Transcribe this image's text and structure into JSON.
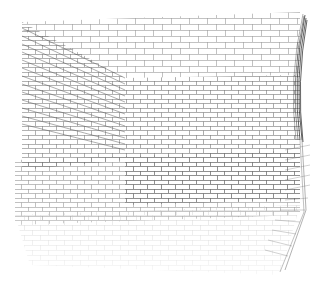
{
  "image": {
    "description": "Wireframe 3D render of a brick-patterned room / box viewed in perspective",
    "background": "#ffffff",
    "line_color": "#555555",
    "dark_edge_color": "#222222"
  },
  "scene": {
    "back_wall": {
      "brick_rows": 20,
      "brick_width": 18,
      "brick_height": 6
    },
    "left_wall": {
      "brick_rows": 26
    },
    "floor": {
      "rows": 12
    },
    "right_edge": {
      "style": "dense dark converging lines"
    }
  }
}
